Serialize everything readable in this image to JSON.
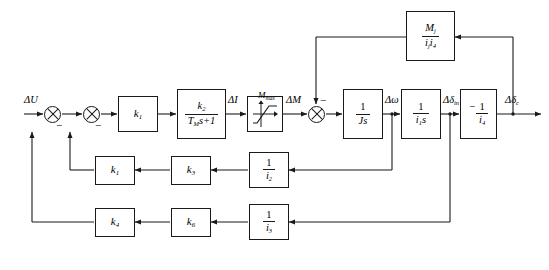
{
  "diagram": {
    "type": "block-diagram",
    "line_color": "#1a1a1a",
    "background": "#ffffff"
  },
  "signals": {
    "input": "ΔU",
    "current": "ΔI",
    "torque_in": "ΔM",
    "torque_limit": "M",
    "torque_limit_sub": "max",
    "speed": "Δω",
    "angle_in": "Δδ",
    "angle_in_sub": "in",
    "angle_out": "Δδ",
    "angle_out_sub": "c"
  },
  "blocks": {
    "gain_k1": {
      "name": "k1-gain",
      "base": "k",
      "sub": "1",
      "kind": "gain"
    },
    "lag": {
      "name": "first-order-lag",
      "kind": "transfer-function",
      "num_base": "k",
      "num_sub": "2",
      "den_base": "T",
      "den_sub": "M",
      "den_tail": "s+1"
    },
    "saturation": {
      "name": "saturation",
      "kind": "nonlinear-saturation",
      "limit_base": "M",
      "limit_sub": "max"
    },
    "integrator_J": {
      "name": "inertia-integrator",
      "kind": "transfer-function",
      "num": "1",
      "den_base": "J",
      "den_tail": "s"
    },
    "integrator_i1": {
      "name": "i1-integrator",
      "kind": "transfer-function",
      "num": "1",
      "den_base": "i",
      "den_sub": "1",
      "den_tail": "s"
    },
    "output_gain": {
      "name": "output-inverting-gain",
      "kind": "transfer-function",
      "prefix": "−",
      "num": "1",
      "den_base": "i",
      "den_sub": "4"
    },
    "top_feedback": {
      "name": "load-torque-feedback",
      "kind": "transfer-function",
      "num_base": "M",
      "num_sub": "j",
      "den_base1": "i",
      "den_sub1": "j",
      "den_base2": "i",
      "den_sub2": "4"
    },
    "mid_fb_i2": {
      "name": "i2-feedback-gain",
      "kind": "transfer-function",
      "num": "1",
      "den_base": "i",
      "den_sub": "2"
    },
    "mid_fb_k3": {
      "name": "k3-feedback-gain",
      "base": "k",
      "sub": "3",
      "kind": "gain"
    },
    "mid_fb_k1b": {
      "name": "k1-feedback-gain",
      "base": "k",
      "sub": "1",
      "kind": "gain"
    },
    "low_fb_i3": {
      "name": "i3-feedback-gain",
      "kind": "transfer-function",
      "num": "1",
      "den_base": "i",
      "den_sub": "3"
    },
    "low_fb_k6": {
      "name": "k6-feedback-gain",
      "base": "k",
      "sub": "6",
      "kind": "gain"
    },
    "low_fb_k4": {
      "name": "k4-feedback-gain",
      "base": "k",
      "sub": "4",
      "kind": "gain"
    }
  },
  "summing_junctions": [
    {
      "name": "sum-1",
      "signs": [
        "-"
      ]
    },
    {
      "name": "sum-2",
      "signs": [
        "-"
      ]
    },
    {
      "name": "sum-3",
      "signs": [
        "-"
      ]
    }
  ],
  "sign_labels": {
    "minus": "−"
  }
}
